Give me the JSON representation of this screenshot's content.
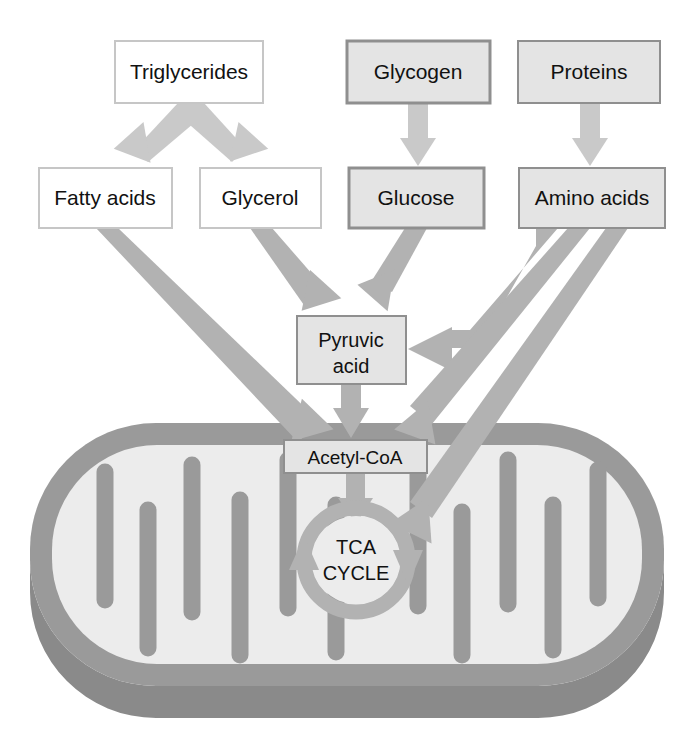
{
  "figure": {
    "type": "diagram"
  },
  "palette": {
    "arrow_light": "#c9c9c9",
    "arrow_mid": "#b2b2b2",
    "membrane": "#9a9a9a",
    "membrane_shadow": "#8a8a8a",
    "matrix": "#ececec",
    "box_fill_white": "#ffffff",
    "box_fill_gray": "#e4e4e4",
    "box_border_light": "#c6c6c6",
    "box_border_dark": "#8f8f8f",
    "text": "#111111",
    "page_background": "#ffffff"
  },
  "nodes": {
    "triglycerides": {
      "label": "Triglycerides",
      "x": 115,
      "y": 41,
      "w": 148,
      "h": 62,
      "fill": "#ffffff",
      "border": "#c6c6c6",
      "font_size": 21
    },
    "glycogen": {
      "label": "Glycogen",
      "x": 347,
      "y": 41,
      "w": 143,
      "h": 62,
      "fill": "#e4e4e4",
      "border": "#8f8f8f",
      "font_size": 21
    },
    "proteins": {
      "label": "Proteins",
      "x": 518,
      "y": 41,
      "w": 142,
      "h": 62,
      "fill": "#e4e4e4",
      "border": "#8f8f8f",
      "font_size": 21
    },
    "fatty_acids": {
      "label": "Fatty acids",
      "x": 39,
      "y": 168,
      "w": 133,
      "h": 60,
      "fill": "#ffffff",
      "border": "#c6c6c6",
      "font_size": 21
    },
    "glycerol": {
      "label": "Glycerol",
      "x": 200,
      "y": 168,
      "w": 121,
      "h": 60,
      "fill": "#ffffff",
      "border": "#c6c6c6",
      "font_size": 21
    },
    "glucose": {
      "label": "Glucose",
      "x": 349,
      "y": 168,
      "w": 135,
      "h": 60,
      "fill": "#e4e4e4",
      "border": "#8f8f8f",
      "font_size": 21
    },
    "amino_acids": {
      "label": "Amino acids",
      "x": 519,
      "y": 168,
      "w": 146,
      "h": 60,
      "fill": "#e4e4e4",
      "border": "#8f8f8f",
      "font_size": 21
    },
    "pyruvic_acid": {
      "label_line1": "Pyruvic",
      "label_line2": "acid",
      "x": 297,
      "y": 316,
      "w": 109,
      "h": 68,
      "fill": "#e4e4e4",
      "border": "#8f8f8f",
      "font_size": 20
    },
    "acetyl_coa": {
      "label": "Acetyl-CoA",
      "x": 284,
      "y": 440,
      "w": 143,
      "h": 33,
      "fill": "#e4e4e4",
      "border": "#8f8f8f",
      "font_size": 19
    },
    "tca_cycle": {
      "label_line1": "TCA",
      "label_line2": "CYCLE",
      "cx": 356,
      "cy": 560,
      "r": 52,
      "font_size": 20
    }
  },
  "edges": [
    {
      "id": "triglycerides-to-fatty-acids",
      "from": "triglycerides",
      "to": "fatty_acids",
      "style": "branch-left",
      "color": "#c9c9c9"
    },
    {
      "id": "triglycerides-to-glycerol",
      "from": "triglycerides",
      "to": "glycerol",
      "style": "branch-right",
      "color": "#c9c9c9"
    },
    {
      "id": "glycogen-to-glucose",
      "from": "glycogen",
      "to": "glucose",
      "style": "straight-down",
      "color": "#c9c9c9"
    },
    {
      "id": "proteins-to-amino-acids",
      "from": "proteins",
      "to": "amino_acids",
      "style": "straight-down",
      "color": "#c9c9c9"
    },
    {
      "id": "fatty-acids-to-acetyl-coa",
      "from": "fatty_acids",
      "to": "acetyl_coa",
      "style": "diagonal-down-right",
      "color": "#b2b2b2"
    },
    {
      "id": "glycerol-to-pyruvic-acid",
      "from": "glycerol",
      "to": "pyruvic_acid",
      "style": "diagonal-down-right",
      "color": "#b2b2b2"
    },
    {
      "id": "glucose-to-pyruvic-acid",
      "from": "glucose",
      "to": "pyruvic_acid",
      "style": "diagonal-down-left",
      "color": "#b2b2b2"
    },
    {
      "id": "amino-acids-to-pyruvic-acid",
      "from": "amino_acids",
      "to": "pyruvic_acid",
      "style": "elbow-left",
      "color": "#b2b2b2"
    },
    {
      "id": "amino-acids-to-acetyl-coa",
      "from": "amino_acids",
      "to": "acetyl_coa",
      "style": "diagonal-down-left",
      "color": "#b2b2b2"
    },
    {
      "id": "amino-acids-to-tca-cycle",
      "from": "amino_acids",
      "to": "tca_cycle",
      "style": "diagonal-down-left",
      "color": "#b2b2b2"
    },
    {
      "id": "pyruvic-acid-to-acetyl-coa",
      "from": "pyruvic_acid",
      "to": "acetyl_coa",
      "style": "straight-down",
      "color": "#b2b2b2"
    },
    {
      "id": "acetyl-coa-to-tca-cycle",
      "from": "acetyl_coa",
      "to": "tca_cycle",
      "style": "straight-down",
      "color": "#b2b2b2"
    }
  ],
  "organelle": {
    "name": "mitochondrion",
    "cristae_count": 9,
    "outer": {
      "x": 30,
      "y": 423,
      "w": 634,
      "h": 254,
      "radius": 126
    }
  }
}
